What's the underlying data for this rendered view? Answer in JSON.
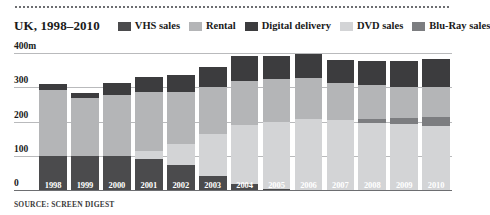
{
  "header": {
    "title": "UK, 1998–2010",
    "source": "SOURCE: SCREEN DIGEST"
  },
  "chart_data": {
    "type": "bar",
    "subtype": "stacked-vertical",
    "title": "UK, 1998–2010",
    "subtitle": "",
    "xlabel": "",
    "ylabel": "",
    "ylim": [
      0,
      400
    ],
    "yticks": [
      0,
      100,
      200,
      300,
      400
    ],
    "ytick_labels": [
      "0",
      "100",
      "200",
      "300",
      "400m"
    ],
    "unit": "m",
    "grid": true,
    "legend_position": "top-right",
    "categories": [
      "1998",
      "1999",
      "2000",
      "2001",
      "2002",
      "2003",
      "2004",
      "2005",
      "2006",
      "2007",
      "2008",
      "2009",
      "2010"
    ],
    "series": [
      {
        "name": "VHS sales",
        "color": "#4b4b4d",
        "values": [
          100,
          98,
          100,
          92,
          72,
          40,
          18,
          4,
          0,
          0,
          0,
          0,
          0
        ]
      },
      {
        "name": "Rental",
        "color": "#b4b5b7",
        "values": [
          192,
          170,
          178,
          172,
          152,
          135,
          128,
          124,
          120,
          108,
          100,
          92,
          88
        ]
      },
      {
        "name": "Digital delivery",
        "color": "#3c3c3e",
        "values": [
          18,
          15,
          35,
          45,
          50,
          58,
          72,
          68,
          70,
          66,
          70,
          76,
          82
        ]
      },
      {
        "name": "DVD sales",
        "color": "#d3d4d6",
        "values": [
          0,
          0,
          0,
          22,
          62,
          125,
          172,
          196,
          208,
          205,
          196,
          192,
          186
        ]
      },
      {
        "name": "Blu-Ray sales",
        "color": "#7c7d80",
        "values": [
          0,
          0,
          0,
          0,
          0,
          0,
          0,
          0,
          0,
          0,
          10,
          18,
          26
        ]
      }
    ],
    "stack_order": [
      "VHS sales",
      "DVD sales",
      "Blu-Ray sales",
      "Rental",
      "Digital delivery"
    ],
    "totals": [
      310,
      283,
      313,
      331,
      336,
      358,
      390,
      392,
      398,
      379,
      376,
      378,
      382
    ]
  },
  "legend": {
    "items": [
      {
        "label": "VHS sales",
        "color": "#4b4b4d"
      },
      {
        "label": "Rental",
        "color": "#b4b5b7"
      },
      {
        "label": "Digital delivery",
        "color": "#3c3c3e"
      },
      {
        "label": "DVD sales",
        "color": "#d3d4d6"
      },
      {
        "label": "Blu-Ray sales",
        "color": "#7c7d80"
      }
    ]
  }
}
